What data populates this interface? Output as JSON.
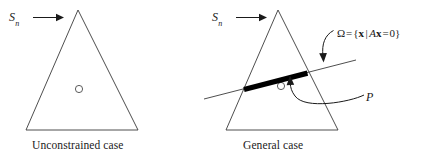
{
  "figure": {
    "background_color": "#ffffff",
    "stroke_color": "#3a3a3a",
    "fill_color": "#000000",
    "width": 421,
    "height": 161
  },
  "panels": [
    {
      "id": "unconstrained",
      "caption": "Unconstrained case",
      "set_label": {
        "symbol": "S",
        "subscript": "n"
      },
      "triangle": {
        "apex": [
          78,
          10
        ],
        "left": [
          26,
          130
        ],
        "right": [
          138,
          130
        ]
      },
      "point_marker": {
        "cx": 79,
        "cy": 89,
        "r": 3.6
      }
    },
    {
      "id": "general",
      "caption": "General case",
      "set_label": {
        "symbol": "S",
        "subscript": "n"
      },
      "triangle": {
        "apex": [
          278,
          10
        ],
        "left": [
          226,
          130
        ],
        "right": [
          338,
          130
        ]
      },
      "point_marker": {
        "cx": 281,
        "cy": 86,
        "r": 3.6
      },
      "constraint_line": {
        "from": [
          204,
          99
        ],
        "to": [
          356,
          60
        ]
      },
      "feasible_segment": {
        "from": [
          244,
          89
        ],
        "to": [
          307,
          73
        ],
        "thickness": 5.2
      },
      "omega_label": {
        "omega": "Ω",
        "equals": "=",
        "open_brace": "{",
        "vector": "x",
        "divider": "|",
        "matrix": "A",
        "vector2": "x",
        "equals2": "=",
        "zero": "0",
        "close_brace": "}",
        "full_text": "Ω = {x | Ax = 0}"
      },
      "p_label": "P"
    }
  ]
}
